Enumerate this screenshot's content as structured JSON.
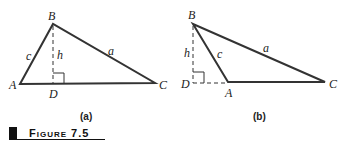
{
  "figure": {
    "caption": "Figure 7.5",
    "panels": [
      {
        "label": "(a)",
        "vertices": {
          "A": "A",
          "B": "B",
          "C": "C",
          "D": "D"
        },
        "sides": {
          "a": "a",
          "c": "c",
          "h": "h"
        }
      },
      {
        "label": "(b)",
        "vertices": {
          "A": "A",
          "B": "B",
          "C": "C",
          "D": "D"
        },
        "sides": {
          "a": "a",
          "c": "c",
          "h": "h"
        }
      }
    ]
  }
}
